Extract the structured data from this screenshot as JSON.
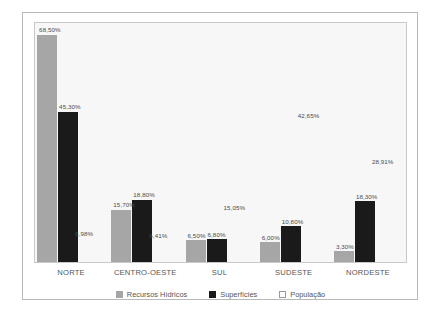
{
  "chart_data": {
    "type": "bar",
    "title": "",
    "xlabel": "",
    "ylabel": "",
    "ylim": [
      0,
      72
    ],
    "grid": false,
    "legend_position": "bottom",
    "categories": [
      "NORTE",
      "CENTRO-OESTE",
      "SUL",
      "SUDESTE",
      "NORDESTE"
    ],
    "series": [
      {
        "name": "Recursos Hídricos",
        "color": "#a6a6a6",
        "values": [
          68.5,
          15.7,
          6.5,
          6.0,
          3.3
        ],
        "labels": [
          "68,50%",
          "15,70%",
          "6,50%",
          "6,00%",
          "3,30%"
        ]
      },
      {
        "name": "Superfícies",
        "color": "#1a1a1a",
        "values": [
          45.3,
          18.8,
          6.8,
          10.8,
          18.3
        ],
        "labels": [
          "45,30%",
          "18,80%",
          "6,80%",
          "10,80%",
          "18,30%"
        ]
      },
      {
        "name": "População",
        "color": "#ffffff",
        "values": [
          6.98,
          6.41,
          15.05,
          42.65,
          28.91
        ],
        "labels": [
          "6,98%",
          "6,41%",
          "15,05%",
          "42,65%",
          "28,91%"
        ]
      }
    ]
  },
  "legend": {
    "items": [
      {
        "label": "Recursos Hídricos",
        "swatch": "gray-swatch-icon"
      },
      {
        "label": "Superfícies",
        "swatch": "black-swatch-icon"
      },
      {
        "label": "População",
        "swatch": "white-swatch-icon"
      }
    ]
  },
  "axis": {
    "categories": [
      "NORTE",
      "CENTRO-OESTE",
      "SUL",
      "SUDESTE",
      "NORDESTE"
    ]
  },
  "colors": {
    "series_gray": "#a6a6a6",
    "series_black": "#1a1a1a",
    "series_white": "#ffffff",
    "plot_background": "#f7f7f7",
    "frame_border": "#b9b9b9",
    "label_text": "#4a4a4a",
    "category_text": "#555555"
  }
}
